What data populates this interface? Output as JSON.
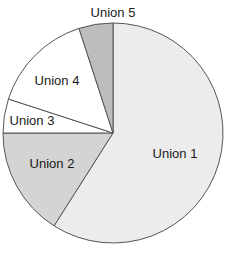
{
  "chart_data": {
    "type": "pie",
    "title": "",
    "categories": [
      "Union 1",
      "Union 2",
      "Union 3",
      "Union 4",
      "Union 5"
    ],
    "values": [
      59,
      16,
      5,
      15,
      5
    ],
    "units": "percent (estimated from slice angles)",
    "start_angle_deg": 0,
    "direction": "clockwise",
    "colors": [
      "#ececec",
      "#d4d4d4",
      "#ffffff",
      "#ffffff",
      "#bdbdbd"
    ],
    "edge_color": "#555555",
    "legend": "none (labels inside slices)",
    "labels": [
      {
        "text": "Union 1",
        "x": 175,
        "y": 158
      },
      {
        "text": "Union 2",
        "x": 52,
        "y": 168
      },
      {
        "text": "Union 3",
        "x": 32,
        "y": 125
      },
      {
        "text": "Union 4",
        "x": 57,
        "y": 85
      },
      {
        "text": "Union 5",
        "x": 113,
        "y": 17
      }
    ]
  },
  "center": {
    "x": 113,
    "y": 133
  },
  "radius": 110
}
